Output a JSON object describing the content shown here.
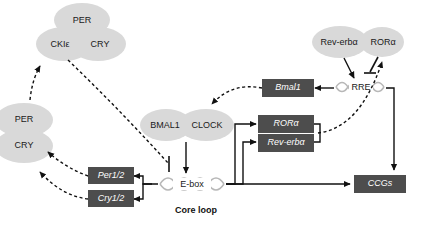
{
  "diagram": {
    "caption": "Core loop",
    "colors": {
      "background": "#ffffff",
      "oval_fill": "#d9d9d9",
      "gene_box_fill": "#4d4d4d",
      "gene_box_text": "#ffffff",
      "line": "#111111",
      "helix": "#b8b8b8"
    },
    "protein_nodes": [
      {
        "id": "per-top",
        "label": "PER"
      },
      {
        "id": "ckie",
        "label": "CKIε"
      },
      {
        "id": "cry-top",
        "label": "CRY"
      },
      {
        "id": "per-left",
        "label": "PER"
      },
      {
        "id": "cry-left",
        "label": "CRY"
      },
      {
        "id": "bmal1-protein",
        "label": "BMAL1"
      },
      {
        "id": "clock-protein",
        "label": "CLOCK"
      },
      {
        "id": "rev-erba-protein",
        "label": "Rev-erbα"
      },
      {
        "id": "rora-protein",
        "label": "RORα"
      }
    ],
    "gene_boxes": [
      {
        "id": "per12",
        "label": "Per1/2"
      },
      {
        "id": "cry12",
        "label": "Cry1/2"
      },
      {
        "id": "bmal1-gene",
        "label": "Bmal1"
      },
      {
        "id": "rora-gene",
        "label": "RORα"
      },
      {
        "id": "rev-erba-gene",
        "label": "Rev-erbα"
      },
      {
        "id": "ccgs",
        "label": "CCGs"
      }
    ],
    "dna_elements": [
      {
        "id": "e-box",
        "label": "E-box"
      },
      {
        "id": "rre",
        "label": "RRE"
      }
    ]
  }
}
